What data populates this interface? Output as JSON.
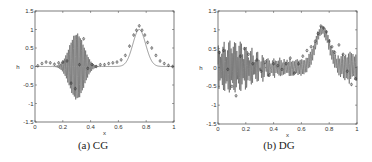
{
  "figure": {
    "panels": [
      {
        "id": "cg",
        "caption": "(a) CG"
      },
      {
        "id": "dg",
        "caption": "(b) DG"
      }
    ]
  },
  "chart_data": [
    {
      "type": "line",
      "title": "(a) CG",
      "xlabel": "x",
      "ylabel": "h",
      "xlim": [
        0,
        1
      ],
      "ylim": [
        -1.5,
        1.5
      ],
      "xticks": [
        0,
        0.2,
        0.4,
        0.6,
        0.8,
        1
      ],
      "xtick_labels": [
        "0",
        "0.2",
        "0.4",
        "0.6",
        "0.8",
        "1"
      ],
      "yticks": [
        -1.5,
        -1,
        -0.5,
        0,
        0.5,
        1,
        1.5
      ],
      "ytick_labels": [
        "-1.5",
        "-1",
        "-0.5",
        "0",
        "0.5",
        "1",
        "1.5"
      ],
      "grid": false,
      "series": [
        {
          "name": "numerical solution (oscillating)",
          "description": "Gaussian hump near x=0.75 (peak ~1.0) plus a high-frequency wave packet centered near x=0.3 with amplitude up to ~0.9",
          "hump": {
            "center": 0.75,
            "width": 0.065,
            "height": 1.0
          },
          "packet": {
            "center": 0.3,
            "width": 0.075,
            "amplitude": 0.9,
            "frequency": 105
          },
          "noise": 0.0
        },
        {
          "name": "markers",
          "marker": "circle-dot",
          "x": [
            0.02,
            0.05,
            0.08,
            0.11,
            0.14,
            0.17,
            0.2,
            0.23,
            0.26,
            0.29,
            0.32,
            0.35,
            0.38,
            0.41,
            0.44,
            0.47,
            0.5,
            0.53,
            0.56,
            0.59,
            0.62,
            0.65,
            0.68,
            0.71,
            0.73,
            0.75,
            0.77,
            0.79,
            0.81,
            0.84,
            0.87,
            0.9,
            0.93,
            0.96,
            0.99
          ],
          "y": [
            0.02,
            0.08,
            0.12,
            0.1,
            0.06,
            0.1,
            0.12,
            0.15,
            -0.45,
            -0.6,
            0.05,
            0.75,
            -0.05,
            0.05,
            0.0,
            0.05,
            0.05,
            0.08,
            0.1,
            0.12,
            0.18,
            0.3,
            0.55,
            0.85,
            0.98,
            1.1,
            0.98,
            0.85,
            0.65,
            0.5,
            0.3,
            0.15,
            0.08,
            0.03,
            0.0
          ]
        }
      ]
    },
    {
      "type": "line",
      "title": "(b) DG",
      "xlabel": "x",
      "ylabel": "h",
      "xlim": [
        0,
        1
      ],
      "ylim": [
        -1.5,
        1.5
      ],
      "xticks": [
        0,
        0.2,
        0.4,
        0.6,
        0.8,
        1
      ],
      "xtick_labels": [
        "0",
        "0.2",
        "0.4",
        "0.6",
        "0.8",
        "1"
      ],
      "yticks": [
        -1.5,
        -1,
        -0.5,
        0,
        0.5,
        1,
        1.5
      ],
      "ytick_labels": [
        "-1.5",
        "-1",
        "-0.5",
        "0",
        "0.5",
        "1",
        "1.5"
      ],
      "grid": false,
      "series": [
        {
          "name": "numerical solution (noisy)",
          "description": "Gaussian hump near x=0.75 (peak ~1.1) with broad-band high-frequency oscillation across domain; larger amplitude (~0.6) near x<0.3 and x>0.85",
          "hump": {
            "center": 0.75,
            "width": 0.07,
            "height": 1.0
          },
          "packet": {
            "center": 0.1,
            "width": 0.2,
            "amplitude": 0.55,
            "frequency": 120
          },
          "noise": 0.22
        },
        {
          "name": "markers",
          "marker": "circle-dot",
          "x": [
            0.01,
            0.04,
            0.07,
            0.1,
            0.13,
            0.16,
            0.19,
            0.22,
            0.25,
            0.28,
            0.31,
            0.34,
            0.37,
            0.4,
            0.43,
            0.46,
            0.49,
            0.52,
            0.55,
            0.58,
            0.61,
            0.64,
            0.67,
            0.7,
            0.72,
            0.74,
            0.76,
            0.78,
            0.8,
            0.82,
            0.84,
            0.87,
            0.9,
            0.93,
            0.96,
            0.99
          ],
          "y": [
            0.4,
            0.45,
            -0.05,
            -0.5,
            -0.75,
            0.3,
            0.5,
            0.35,
            0.1,
            0.2,
            -0.1,
            0.15,
            -0.2,
            0.1,
            0.05,
            -0.05,
            0.1,
            0.25,
            -0.15,
            0.1,
            0.3,
            0.45,
            0.55,
            0.7,
            0.9,
            1.1,
            1.05,
            0.95,
            0.7,
            0.55,
            0.4,
            0.6,
            0.35,
            -0.1,
            -0.45,
            -0.3
          ]
        }
      ]
    }
  ]
}
